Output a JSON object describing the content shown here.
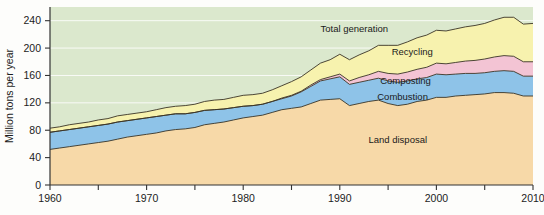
{
  "chart_data": {
    "type": "area",
    "title": "",
    "subtitle": "",
    "xlabel": "",
    "ylabel": "Million tons per year",
    "xlim": [
      1960,
      2010
    ],
    "ylim": [
      0,
      260
    ],
    "xticks": [
      1960,
      1965,
      1970,
      1975,
      1980,
      1985,
      1990,
      1995,
      2000,
      2005,
      2010
    ],
    "xtick_labels": [
      "1960",
      "",
      "1970",
      "",
      "1980",
      "",
      "1990",
      "",
      "2000",
      "",
      "2010"
    ],
    "yticks": [
      0,
      40,
      80,
      120,
      160,
      200,
      240
    ],
    "ytick_labels": [
      "0",
      "40",
      "80",
      "120",
      "160",
      "200",
      "240"
    ],
    "grid": true,
    "legend_position": "inline-annotations",
    "stacked": true,
    "annotations": [
      {
        "text": "Total generation",
        "x": 1991.5,
        "y": 228,
        "color": "#1a1a1a"
      },
      {
        "text": "Recycling",
        "x": 1997.5,
        "y": 195,
        "color": "#1a1a1a"
      },
      {
        "text": "Composting",
        "x": 1996.8,
        "y": 152,
        "color": "#1a1a1a"
      },
      {
        "text": "Combustion",
        "x": 1996.5,
        "y": 129,
        "color": "#1a1a1a"
      },
      {
        "text": "Land disposal",
        "x": 1996.0,
        "y": 66,
        "color": "#2b2b2b"
      }
    ],
    "x": [
      1960,
      1961,
      1962,
      1963,
      1964,
      1965,
      1966,
      1967,
      1968,
      1969,
      1970,
      1971,
      1972,
      1973,
      1974,
      1975,
      1976,
      1977,
      1978,
      1979,
      1980,
      1981,
      1982,
      1983,
      1984,
      1985,
      1986,
      1987,
      1988,
      1989,
      1990,
      1991,
      1992,
      1993,
      1994,
      1995,
      1996,
      1997,
      1998,
      1999,
      2000,
      2001,
      2002,
      2003,
      2004,
      2005,
      2006,
      2007,
      2008,
      2009,
      2010
    ],
    "series": [
      {
        "name": "Land disposal",
        "color": "#f7d9a8",
        "values": [
          52,
          54,
          56,
          58,
          60,
          62,
          64,
          67,
          70,
          72,
          74,
          76,
          79,
          81,
          82,
          84,
          88,
          90,
          92,
          95,
          98,
          100,
          102,
          106,
          110,
          112,
          114,
          119,
          124,
          125,
          126,
          116,
          119,
          122,
          124,
          119,
          116,
          118,
          122,
          124,
          128,
          128,
          130,
          131,
          132,
          133,
          135,
          135,
          134,
          130,
          130
        ]
      },
      {
        "name": "Combustion",
        "color": "#8ec3e8",
        "values": [
          25,
          25,
          25,
          25,
          25,
          25,
          25,
          25,
          24,
          24,
          24,
          24,
          23,
          23,
          22,
          22,
          21,
          20,
          19,
          18,
          17,
          16,
          16,
          16,
          16,
          18,
          22,
          25,
          28,
          30,
          32,
          31,
          31,
          31,
          32,
          33,
          34,
          34,
          33,
          33,
          34,
          33,
          32,
          32,
          31,
          31,
          31,
          32,
          32,
          29,
          29
        ]
      },
      {
        "name": "Composting",
        "color": "#f3c4d4",
        "values": [
          0,
          0,
          0,
          0,
          0,
          0,
          0,
          0,
          0,
          0,
          0,
          0,
          0,
          0,
          0,
          0,
          0,
          0,
          0,
          0,
          0,
          0,
          0,
          0,
          1,
          1,
          1,
          2,
          2,
          3,
          4,
          5,
          7,
          8,
          10,
          11,
          12,
          13,
          14,
          15,
          16,
          16,
          17,
          18,
          19,
          20,
          21,
          22,
          22,
          21,
          21
        ]
      },
      {
        "name": "Recycling",
        "color": "#f7f2ae",
        "values": [
          6,
          6,
          7,
          7,
          7,
          8,
          8,
          9,
          9,
          9,
          9,
          10,
          11,
          11,
          12,
          12,
          13,
          14,
          14,
          15,
          16,
          16,
          16,
          17,
          18,
          20,
          21,
          22,
          24,
          25,
          29,
          31,
          33,
          35,
          38,
          41,
          42,
          44,
          46,
          47,
          48,
          48,
          49,
          50,
          51,
          52,
          54,
          56,
          57,
          55,
          56
        ]
      }
    ],
    "total_generation": [
      83,
      85,
      88,
      90,
      92,
      95,
      97,
      101,
      103,
      105,
      107,
      110,
      113,
      115,
      116,
      118,
      122,
      124,
      125,
      128,
      131,
      132,
      134,
      139,
      145,
      151,
      158,
      168,
      178,
      183,
      191,
      183,
      190,
      196,
      204,
      204,
      204,
      209,
      215,
      219,
      226,
      225,
      228,
      231,
      233,
      236,
      241,
      245,
      245,
      235,
      236
    ],
    "plot_background": "#dbe8cd",
    "source_note": ""
  },
  "axes": {
    "ylabel": "Million tons per year"
  }
}
